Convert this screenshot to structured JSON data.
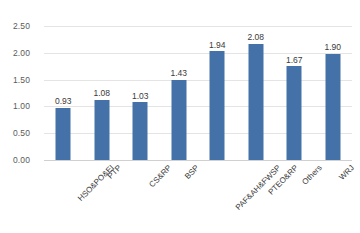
{
  "chart_data": {
    "type": "bar",
    "title": "",
    "subtitle": "",
    "xlabel": "",
    "ylabel": "",
    "categories": [
      "HSO&PO&EI",
      "PTP",
      "CS&RP",
      "BSP",
      "PAF&AH&FWSP",
      "PTEO&RP",
      "Others",
      "WRJ"
    ],
    "values": [
      0.93,
      1.08,
      1.03,
      1.43,
      1.94,
      2.08,
      1.67,
      1.9
    ],
    "data_labels": [
      "0.93",
      "1.08",
      "1.03",
      "1.43",
      "1.94",
      "2.08",
      "1.67",
      "1.90"
    ],
    "ylim": [
      0.0,
      2.5
    ],
    "ytick_values": [
      0.0,
      0.5,
      1.0,
      1.5,
      2.0,
      2.5
    ],
    "ytick_labels": [
      "0.00",
      "0.50",
      "1.00",
      "1.50",
      "2.00",
      "2.50"
    ],
    "grid": "horizontal",
    "legend": "none",
    "series": [
      {
        "name": "",
        "values": [
          0.93,
          1.08,
          1.03,
          1.43,
          1.94,
          2.08,
          1.67,
          1.9
        ]
      }
    ],
    "colors": {
      "bar": "#4472a8",
      "gridline": "#e4e4e4",
      "axis": "#d0d0d0",
      "tick_text": "#5a5a5a",
      "label_text": "#3a3a3a",
      "background": "#ffffff"
    }
  }
}
